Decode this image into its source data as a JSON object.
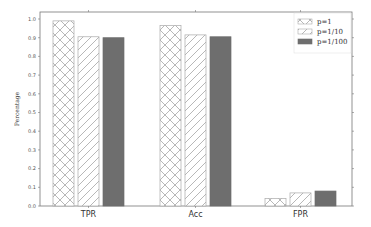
{
  "chart_data": {
    "type": "bar",
    "title": "",
    "xlabel": "",
    "ylabel": "Percentage",
    "ylim": [
      0.0,
      1.0
    ],
    "yticks": [
      "0.0",
      "0.1",
      "0.2",
      "0.3",
      "0.4",
      "0.5",
      "0.6",
      "0.7",
      "0.8",
      "0.9",
      "1.0"
    ],
    "grid": false,
    "legend_position": "upper right",
    "categories": [
      "TPR",
      "Acc",
      "FPR"
    ],
    "series": [
      {
        "name": "p=1",
        "pattern": "crosshatch",
        "color": "#ffffff",
        "values": [
          0.99,
          0.965,
          0.04
        ]
      },
      {
        "name": "p=1/10",
        "pattern": "diagonal",
        "color": "#ffffff",
        "values": [
          0.905,
          0.915,
          0.07
        ]
      },
      {
        "name": "p=1/100",
        "pattern": "solid",
        "color": "#6e6e6e",
        "values": [
          0.9,
          0.905,
          0.08
        ]
      }
    ]
  }
}
